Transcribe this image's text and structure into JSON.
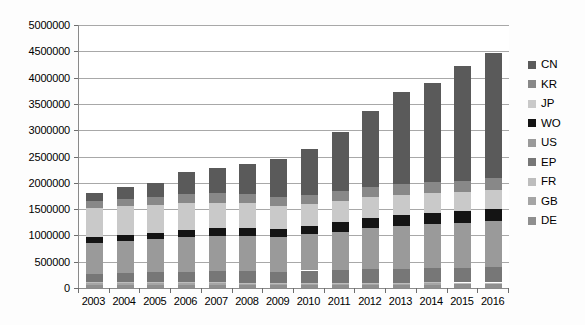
{
  "chart_data": {
    "type": "bar",
    "stacked": true,
    "title": "",
    "subtitle": "",
    "xlabel": "",
    "ylabel": "",
    "grid": true,
    "legend_position": "right",
    "categories": [
      "2003",
      "2004",
      "2005",
      "2006",
      "2007",
      "2008",
      "2009",
      "2010",
      "2011",
      "2012",
      "2013",
      "2014",
      "2015",
      "2016"
    ],
    "ylim": [
      0,
      5000000
    ],
    "ytick_step": 500000,
    "ytick_labels": [
      "5000000",
      "4500000",
      "4000000",
      "3500000",
      "3000000",
      "2500000",
      "2000000",
      "1500000",
      "1000000",
      "500000",
      "0"
    ],
    "ytick_values": [
      5000000,
      4500000,
      4000000,
      3500000,
      3000000,
      2500000,
      2000000,
      1500000,
      1000000,
      500000,
      0
    ],
    "stack_order_bottom_to_top": [
      "DE",
      "GB",
      "FR",
      "EP",
      "US",
      "WO",
      "JP",
      "KR",
      "CN"
    ],
    "legend_order_top_to_bottom": [
      "CN",
      "KR",
      "JP",
      "WO",
      "US",
      "EP",
      "FR",
      "GB",
      "DE"
    ],
    "series": [
      {
        "name": "DE",
        "color": "#8f8f8f",
        "values": [
          60000,
          60000,
          60000,
          60000,
          62000,
          62000,
          60000,
          60000,
          62000,
          62000,
          63000,
          65000,
          67000,
          67000
        ]
      },
      {
        "name": "GB",
        "color": "#a5a5a5",
        "values": [
          30000,
          30000,
          28000,
          28000,
          26000,
          25000,
          23000,
          22000,
          22000,
          23000,
          23000,
          23000,
          22000,
          22000
        ]
      },
      {
        "name": "FR",
        "color": "#bdbdbd",
        "values": [
          17000,
          17000,
          17000,
          17000,
          17000,
          17000,
          16000,
          16000,
          16000,
          16000,
          17000,
          17000,
          16000,
          16000
        ]
      },
      {
        "name": "EP",
        "color": "#777777",
        "values": [
          163000,
          178000,
          193000,
          208000,
          218000,
          216000,
          210000,
          235000,
          244000,
          258000,
          266000,
          274000,
          280000,
          296000
        ]
      },
      {
        "name": "US",
        "color": "#9a9a9a",
        "values": [
          580000,
          600000,
          625000,
          650000,
          660000,
          670000,
          660000,
          690000,
          730000,
          780000,
          810000,
          840000,
          855000,
          870000
        ]
      },
      {
        "name": "WO",
        "color": "#141414",
        "values": [
          115000,
          120000,
          125000,
          140000,
          155000,
          160000,
          153000,
          160000,
          175000,
          190000,
          200000,
          215000,
          218000,
          233000
        ]
      },
      {
        "name": "JP",
        "color": "#c9c9c9",
        "values": [
          560000,
          550000,
          525000,
          510000,
          480000,
          460000,
          430000,
          410000,
          400000,
          395000,
          380000,
          370000,
          360000,
          350000
        ]
      },
      {
        "name": "KR",
        "color": "#888888",
        "values": [
          130000,
          145000,
          165000,
          175000,
          180000,
          175000,
          170000,
          180000,
          195000,
          205000,
          215000,
          220000,
          225000,
          230000
        ]
      },
      {
        "name": "CN",
        "color": "#5a5a5a",
        "values": [
          145000,
          230000,
          262000,
          412000,
          482000,
          575000,
          728000,
          877000,
          1126000,
          1441000,
          1756000,
          1876000,
          2187000,
          2386000
        ]
      }
    ],
    "totals": [
      1800000,
      1930000,
      2000000,
      2200000,
      2280000,
      2360000,
      2450000,
      2650000,
      2970000,
      3370000,
      3730000,
      3900000,
      4230000,
      4470000
    ]
  },
  "legend": {
    "items": [
      {
        "label": "CN",
        "color": "#5a5a5a"
      },
      {
        "label": "KR",
        "color": "#888888"
      },
      {
        "label": "JP",
        "color": "#c9c9c9"
      },
      {
        "label": "WO",
        "color": "#141414"
      },
      {
        "label": "US",
        "color": "#9a9a9a"
      },
      {
        "label": "EP",
        "color": "#777777"
      },
      {
        "label": "FR",
        "color": "#bdbdbd"
      },
      {
        "label": "GB",
        "color": "#a5a5a5"
      },
      {
        "label": "DE",
        "color": "#8f8f8f"
      }
    ]
  }
}
